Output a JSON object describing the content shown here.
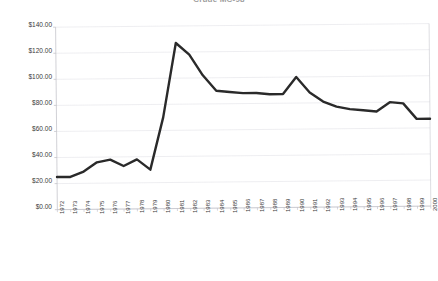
{
  "chart_title": "Crude MC-98",
  "chart_data": {
    "type": "line",
    "title": "Crude MC-98",
    "xlabel": "",
    "ylabel": "",
    "grid": true,
    "legend": false,
    "ylim": [
      0,
      140
    ],
    "xlim": [
      "1972",
      "2000"
    ],
    "y_tick_labels": [
      "$140.00",
      "$120.00",
      "$100.00",
      "$80.00",
      "$60.00",
      "$40.00",
      "$20.00",
      "$0.00"
    ],
    "y_tick_values": [
      140,
      120,
      100,
      80,
      60,
      40,
      20,
      0
    ],
    "categories": [
      "1972",
      "1973",
      "1974",
      "1975",
      "1976",
      "1977",
      "1978",
      "1979",
      "1980",
      "1981",
      "1982",
      "1983",
      "1984",
      "1985",
      "1986",
      "1987",
      "1988",
      "1989",
      "1990",
      "1991",
      "1992",
      "1993",
      "1994",
      "1995",
      "1996",
      "1997",
      "1998",
      "1999",
      "2000"
    ],
    "series": [
      {
        "name": "Crude MC-98",
        "color": "#2a2a2a",
        "values": [
          25,
          25,
          29,
          36,
          38,
          33,
          38,
          30,
          70,
          127,
          118,
          102,
          90,
          89,
          88,
          88,
          87,
          87,
          100,
          88,
          81,
          77,
          75,
          74,
          73,
          80,
          79,
          67,
          67
        ]
      }
    ]
  },
  "style": {
    "line_color": "#2a2a2a",
    "grid_color": "#e2e2e8",
    "axis_color": "#bdbdc4",
    "background": "#ffffff",
    "text_color": "#3a3a3a"
  }
}
